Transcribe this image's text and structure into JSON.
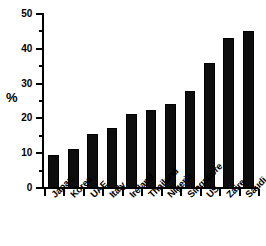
{
  "chart_data": {
    "type": "bar",
    "title": "",
    "subtitle": "",
    "xlabel": "",
    "ylabel": "%",
    "categories": [
      "Japan",
      "Korea",
      "UAE",
      "Italy",
      "Ireland",
      "Thailand",
      "Nigeria",
      "Singapore",
      "US",
      "Zaire",
      "Saudi"
    ],
    "values": [
      9.5,
      11.3,
      15.4,
      17.2,
      21.4,
      22.3,
      24.0,
      27.9,
      36.0,
      43.0,
      45.0
    ],
    "series": [
      {
        "name": "percent",
        "values": [
          9.5,
          11.3,
          15.4,
          17.2,
          21.4,
          22.3,
          24.0,
          27.9,
          36.0,
          43.0,
          45.0
        ]
      }
    ],
    "ylim": [
      0,
      50
    ],
    "y_major_ticks": [
      0,
      10,
      20,
      30,
      40,
      50
    ],
    "y_minor_ticks": [
      5,
      15,
      25,
      35,
      45
    ],
    "y_tick_labels": [
      "0",
      "10",
      "20",
      "30",
      "40",
      "50"
    ],
    "grid": false,
    "legend": false,
    "legend_position": "none",
    "bar_color": "#0d0d0d",
    "axis_color": "#000000",
    "background_color": "#ffffff",
    "x_label_rotation": -45
  }
}
